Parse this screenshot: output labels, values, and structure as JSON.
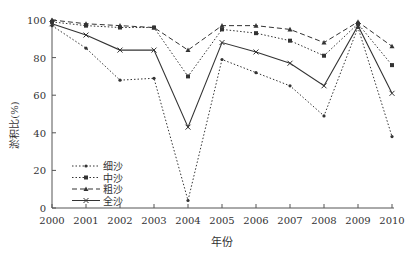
{
  "chart_data": {
    "type": "line",
    "title": "",
    "xlabel": "年份",
    "ylabel": "淤积比(%)",
    "x": [
      "2000",
      "2001",
      "2002",
      "2003",
      "2004",
      "2005",
      "2006",
      "2007",
      "2008",
      "2009",
      "2010"
    ],
    "ylim": [
      0,
      100
    ],
    "yticks": [
      0,
      20,
      40,
      60,
      80,
      100
    ],
    "grid": false,
    "legend_position": "lower-left",
    "series": [
      {
        "name": "细沙",
        "style": "dotted",
        "marker": "dot",
        "values": [
          97,
          85,
          68,
          69,
          4,
          79,
          72,
          65,
          49,
          96,
          38
        ]
      },
      {
        "name": "中沙",
        "style": "dotted",
        "marker": "square",
        "values": [
          99,
          97,
          96,
          96,
          70,
          95,
          93,
          89,
          81,
          98,
          76
        ]
      },
      {
        "name": "粗沙",
        "style": "dashed",
        "marker": "triangle",
        "values": [
          100,
          98,
          97,
          96,
          84,
          97,
          97,
          95,
          88,
          99,
          86
        ]
      },
      {
        "name": "全沙",
        "style": "solid",
        "marker": "x",
        "values": [
          98,
          92,
          84,
          84,
          43,
          88,
          83,
          77,
          65,
          97,
          61
        ]
      }
    ]
  },
  "colors": {
    "line": "#333333",
    "axis": "#555555"
  }
}
